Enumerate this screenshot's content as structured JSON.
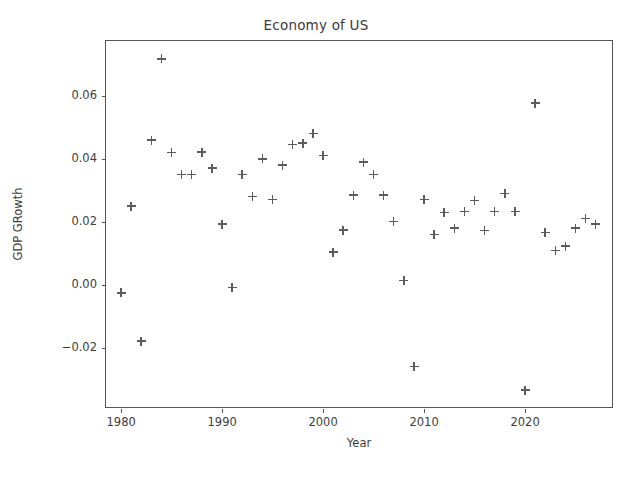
{
  "chart_data": {
    "type": "scatter",
    "title": "Economy of US",
    "xlabel": "Year",
    "ylabel": "GDP GRowth",
    "marker": "+",
    "marker_color": "#5c5c5c",
    "grid": false,
    "legend": null,
    "xlim": [
      1978.5,
      2028.8
    ],
    "ylim": [
      -0.0395,
      0.0775
    ],
    "xticks": [
      1980,
      1990,
      2000,
      2010,
      2020
    ],
    "xticklabels": [
      "1980",
      "1990",
      "2000",
      "2010",
      "2020"
    ],
    "yticks": [
      -0.02,
      0.0,
      0.02,
      0.04,
      0.06
    ],
    "yticklabels": [
      "−0.02",
      "0.00",
      "0.02",
      "0.04",
      "0.06"
    ],
    "x": [
      1980,
      1981,
      1982,
      1983,
      1984,
      1985,
      1986,
      1987,
      1988,
      1989,
      1990,
      1991,
      1992,
      1993,
      1994,
      1995,
      1996,
      1997,
      1998,
      1999,
      2000,
      2001,
      2002,
      2003,
      2004,
      2005,
      2006,
      2007,
      2008,
      2009,
      2010,
      2011,
      2012,
      2013,
      2014,
      2015,
      2016,
      2017,
      2018,
      2019,
      2020,
      2021,
      2022,
      2023,
      2024,
      2025,
      2026,
      2027
    ],
    "y": [
      -0.0026,
      0.025,
      -0.018,
      0.0459,
      0.0718,
      0.042,
      0.035,
      0.035,
      0.0421,
      0.037,
      0.0192,
      -0.0009,
      0.035,
      0.028,
      0.04,
      0.027,
      0.038,
      0.0445,
      0.045,
      0.048,
      0.041,
      0.0104,
      0.0174,
      0.0285,
      0.039,
      0.035,
      0.0285,
      0.02,
      0.0013,
      -0.026,
      0.027,
      0.016,
      0.023,
      0.018,
      0.0232,
      0.0268,
      0.0172,
      0.0233,
      0.029,
      0.0232,
      -0.0335,
      0.0577,
      0.0165,
      0.0109,
      0.0122,
      0.018,
      0.021,
      0.0193
    ]
  }
}
